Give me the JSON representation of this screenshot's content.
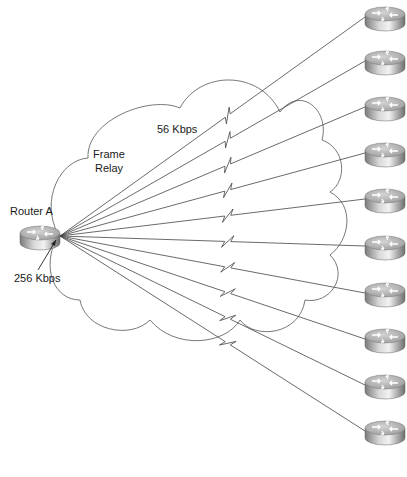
{
  "diagram": {
    "type": "network-topology",
    "hub": {
      "name": "Router A",
      "link_speed": "256 Kbps",
      "x": 40,
      "y": 233
    },
    "cloud": {
      "label_line1": "Frame",
      "label_line2": "Relay"
    },
    "spoke_link_speed": "56 Kbps",
    "spokes": [
      {
        "id": 1,
        "x": 385,
        "y": 14
      },
      {
        "id": 2,
        "x": 385,
        "y": 58
      },
      {
        "id": 3,
        "x": 385,
        "y": 104
      },
      {
        "id": 4,
        "x": 385,
        "y": 150
      },
      {
        "id": 5,
        "x": 385,
        "y": 196
      },
      {
        "id": 6,
        "x": 385,
        "y": 243
      },
      {
        "id": 7,
        "x": 385,
        "y": 290
      },
      {
        "id": 8,
        "x": 385,
        "y": 336
      },
      {
        "id": 9,
        "x": 385,
        "y": 382
      },
      {
        "id": 10,
        "x": 385,
        "y": 428
      }
    ],
    "colors": {
      "line": "#444444",
      "router_top": "#bcbcbc",
      "router_side": "#8a8a8a"
    }
  }
}
